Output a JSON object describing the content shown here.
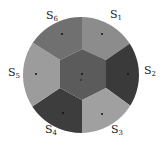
{
  "diagram": {
    "type": "sector-partition",
    "center_region": {
      "name": "center hexagon",
      "color": "#5b5b5b"
    },
    "sectors": [
      {
        "label": "S",
        "sub": "1",
        "color": "#8c8c8c"
      },
      {
        "label": "S",
        "sub": "2",
        "color": "#3a3a3a"
      },
      {
        "label": "S",
        "sub": "3",
        "color": "#a0a0a0"
      },
      {
        "label": "S",
        "sub": "4",
        "color": "#3d3d3d"
      },
      {
        "label": "S",
        "sub": "5",
        "color": "#9c9c9c"
      },
      {
        "label": "S",
        "sub": "6",
        "color": "#707070"
      }
    ]
  }
}
